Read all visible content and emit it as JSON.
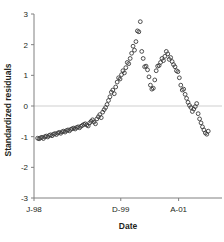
{
  "chart_data": {
    "type": "scatter",
    "title": "",
    "xlabel": "Date",
    "ylabel": "Standardized residuals",
    "grid": false,
    "zero_line": true,
    "legend": "none",
    "marker": "open-circle",
    "marker_color": "#3a3a3a",
    "zero_line_color": "#cfcfcf",
    "axis_color": "#808080",
    "ylim": [
      -3,
      3
    ],
    "yticks": [
      -3,
      -2,
      -1,
      0,
      1,
      2,
      3
    ],
    "ytick_labels": [
      "-3",
      "-2",
      "-1",
      "0",
      "1",
      "2",
      "3"
    ],
    "xticks": [
      0,
      24,
      40
    ],
    "xtick_labels": [
      "J-98",
      "D-99",
      "A-01"
    ],
    "xlim": [
      0,
      52
    ],
    "x": [
      1.0,
      1.4,
      1.8,
      2.2,
      2.6,
      3.0,
      3.4,
      3.8,
      4.2,
      4.6,
      5.0,
      5.4,
      5.8,
      6.2,
      6.6,
      7.0,
      7.4,
      7.8,
      8.2,
      8.6,
      9.0,
      9.4,
      9.8,
      10.2,
      10.6,
      11.0,
      11.4,
      11.8,
      12.2,
      12.6,
      13.0,
      13.4,
      13.8,
      14.2,
      14.6,
      15.0,
      15.4,
      15.8,
      16.2,
      16.6,
      17.0,
      17.4,
      17.8,
      18.2,
      18.6,
      19.0,
      19.4,
      19.8,
      20.2,
      20.6,
      21.0,
      21.4,
      21.8,
      22.2,
      22.6,
      23.0,
      23.4,
      23.8,
      24.2,
      24.6,
      25.0,
      25.4,
      25.8,
      26.2,
      26.6,
      27.0,
      27.4,
      27.8,
      28.2,
      28.6,
      29.0,
      29.4,
      29.8,
      30.2,
      30.6,
      31.0,
      31.4,
      31.8,
      32.2,
      32.6,
      33.0,
      33.4,
      33.8,
      34.2,
      34.6,
      35.0,
      35.4,
      35.8,
      36.2,
      36.6,
      37.0,
      37.4,
      37.8,
      38.2,
      38.6,
      39.0,
      39.4,
      39.8,
      40.2,
      40.6,
      41.0,
      41.4,
      41.8,
      42.2,
      42.6,
      43.0,
      43.4,
      43.8,
      44.2,
      44.6,
      45.0,
      45.4,
      45.8,
      46.2,
      46.6,
      47.0,
      47.4,
      47.8,
      48.2
    ],
    "y": [
      -1.05,
      -1.07,
      -1.04,
      -1.02,
      -1.06,
      -1.0,
      -0.98,
      -1.01,
      -0.96,
      -0.94,
      -0.97,
      -0.92,
      -0.9,
      -0.93,
      -0.88,
      -0.86,
      -0.89,
      -0.84,
      -0.82,
      -0.85,
      -0.8,
      -0.78,
      -0.81,
      -0.76,
      -0.74,
      -0.72,
      -0.75,
      -0.7,
      -0.68,
      -0.71,
      -0.66,
      -0.63,
      -0.6,
      -0.58,
      -0.62,
      -0.65,
      -0.55,
      -0.5,
      -0.45,
      -0.52,
      -0.58,
      -0.42,
      -0.35,
      -0.28,
      -0.38,
      -0.2,
      -0.12,
      -0.05,
      0.05,
      0.18,
      0.3,
      0.45,
      0.52,
      0.4,
      0.62,
      0.78,
      0.92,
      0.88,
      1.02,
      1.15,
      1.08,
      1.25,
      1.42,
      1.38,
      1.55,
      1.72,
      1.95,
      1.82,
      2.1,
      2.45,
      2.42,
      2.75,
      1.78,
      1.55,
      1.28,
      1.3,
      1.18,
      0.95,
      0.68,
      0.55,
      0.58,
      0.85,
      1.15,
      1.3,
      1.32,
      1.42,
      1.55,
      1.48,
      1.62,
      1.78,
      1.7,
      1.52,
      1.58,
      1.45,
      1.35,
      1.28,
      1.15,
      1.12,
      0.92,
      0.68,
      0.52,
      0.55,
      0.38,
      0.25,
      0.12,
      0.02,
      -0.05,
      -0.18,
      -0.1,
      -0.02,
      0.08,
      -0.25,
      -0.42,
      -0.55,
      -0.68,
      -0.78,
      -0.88,
      -0.92,
      -0.82
    ]
  },
  "axes": {
    "ylabel": "Standardized residuals",
    "xlabel": "Date"
  }
}
